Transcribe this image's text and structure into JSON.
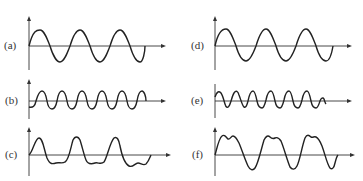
{
  "panels": [
    {
      "label": "(a)",
      "description": "sine wave, 3 cycles, large amplitude, starts rising at origin"
    },
    {
      "label": "(b)",
      "description": "sine wave, 6 cycles (double frequency), smaller amplitude, starts slightly below axis"
    },
    {
      "label": "(c)",
      "description": "fundamental plus harmonic: sharp positive peaks, flattened wavy troughs"
    },
    {
      "label": "(d)",
      "description": "sine wave, 3 cycles, large amplitude, starts rising at origin"
    },
    {
      "label": "(e)",
      "description": "sine wave, 6 cycles (triple-ish frequency), smaller amplitude"
    },
    {
      "label": "(f)",
      "description": "fundamental plus harmonic: double-humped flattened peaks, rounded troughs"
    }
  ]
}
